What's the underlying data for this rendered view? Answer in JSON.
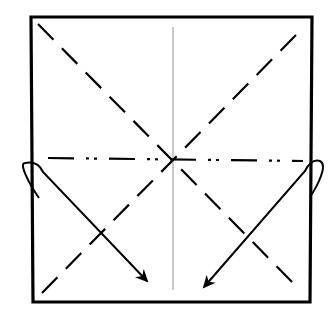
{
  "diagram": {
    "type": "origami-instruction-step",
    "paper": {
      "corners": [
        [
          31,
          17
        ],
        [
          312,
          17
        ],
        [
          310,
          302
        ],
        [
          33,
          302
        ]
      ],
      "stroke": "#000000",
      "fill": "#ffffff"
    },
    "creases": {
      "valley_diagonal_1": {
        "from": [
          38,
          24
        ],
        "to": [
          300,
          290
        ],
        "style": "dashed"
      },
      "valley_diagonal_2": {
        "from": [
          42,
          290
        ],
        "to": [
          294,
          35
        ],
        "style": "dashed"
      },
      "mountain_horizontal": {
        "from": [
          48,
          158
        ],
        "to": [
          302,
          161
        ],
        "style": "dash-dot"
      },
      "vertical_center": {
        "from": [
          173,
          27
        ],
        "to": [
          173,
          290
        ],
        "style": "thin-solid"
      }
    },
    "arrows": [
      {
        "name": "left-fold-arrow",
        "start": [
          40,
          170
        ],
        "end": [
          147,
          282
        ],
        "loop_side": "left"
      },
      {
        "name": "right-fold-arrow",
        "start": [
          308,
          170
        ],
        "end": [
          203,
          288
        ],
        "loop_side": "right"
      }
    ]
  }
}
